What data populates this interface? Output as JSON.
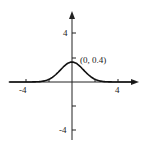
{
  "chart_data": {
    "type": "line",
    "title": "",
    "xlabel": "",
    "ylabel": "",
    "function": "standard normal density y = (1/sqrt(2*pi)) * e^(-x^2/2)",
    "x": [
      -5,
      -4,
      -3,
      -2,
      -1,
      0,
      1,
      2,
      3,
      4,
      5
    ],
    "values": [
      0.0,
      0.0001,
      0.004,
      0.054,
      0.242,
      0.4,
      0.242,
      0.054,
      0.004,
      0.0001,
      0.0
    ],
    "xlim": [
      -6,
      6
    ],
    "ylim": [
      -5,
      6
    ],
    "x_ticks": [
      -4,
      -2,
      2,
      4
    ],
    "x_tick_labels": [
      "-4",
      "4"
    ],
    "y_ticks": [
      -4,
      -2,
      2,
      4
    ],
    "y_tick_labels": [
      "-4",
      "4"
    ],
    "annotations": [
      {
        "text": "(0, 0.4)",
        "x": 0,
        "y": 0.4
      }
    ],
    "grid": false,
    "legend": null
  },
  "labels": {
    "x_neg4": "-4",
    "x_pos4": "4",
    "y_pos4": "4",
    "y_neg4": "-4",
    "peak": "(0, 0.4)"
  }
}
